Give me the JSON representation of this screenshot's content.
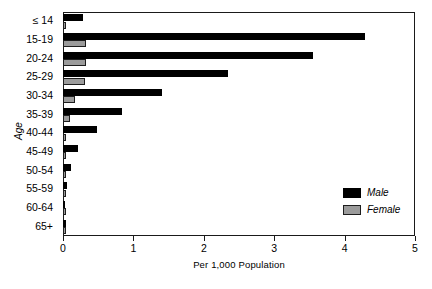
{
  "chart_data": {
    "type": "bar",
    "orientation": "horizontal",
    "title": "",
    "xlabel": "Per 1,000 Population",
    "ylabel": "Age",
    "xlim": [
      0,
      5
    ],
    "ylim": null,
    "grid": false,
    "legend_position": "inside-bottom-right",
    "xticks": [
      0,
      1,
      2,
      3,
      4,
      5
    ],
    "xticklabels": [
      "0",
      "1",
      "2",
      "3",
      "4",
      "5"
    ],
    "categories": [
      "≤ 14",
      "15-19",
      "20-24",
      "25-29",
      "30-34",
      "35-39",
      "40-44",
      "45-49",
      "50-54",
      "55-59",
      "60-64",
      "65+"
    ],
    "series": [
      {
        "name": "Male",
        "color": "#000000",
        "values": [
          0.28,
          4.29,
          3.55,
          2.34,
          1.41,
          0.84,
          0.48,
          0.22,
          0.11,
          0.06,
          0.03,
          0.04
        ]
      },
      {
        "name": "Female",
        "color": "#9b9b9b",
        "values": [
          0.02,
          0.32,
          0.32,
          0.31,
          0.17,
          0.1,
          0.03,
          0.02,
          0.015,
          0.01,
          0.01,
          0.015
        ]
      }
    ]
  },
  "legend": {
    "entries": [
      {
        "label": "Male",
        "swatch": "male"
      },
      {
        "label": "Female",
        "swatch": "female"
      }
    ]
  },
  "axes": {
    "x_title": "Per 1,000 Population",
    "y_title": "Age"
  }
}
